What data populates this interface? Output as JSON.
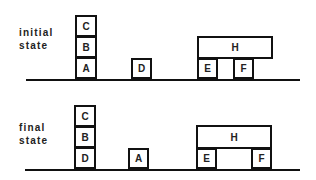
{
  "initial": {
    "label_line1": "initial",
    "label_line2": "state",
    "blocks": {
      "C": "C",
      "B": "B",
      "A": "A",
      "D": "D",
      "H": "H",
      "E": "E",
      "F": "F"
    }
  },
  "final": {
    "label_line1": "final",
    "label_line2": "state",
    "blocks": {
      "C": "C",
      "B": "B",
      "D": "D",
      "A": "A",
      "H": "H",
      "E": "E",
      "F": "F"
    }
  }
}
